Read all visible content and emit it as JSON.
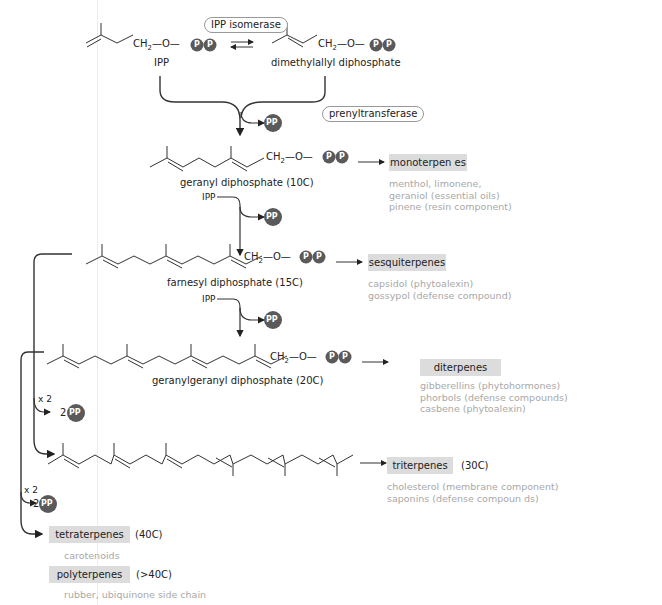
{
  "enzymes": {
    "isomerase": "IPP isomerase",
    "prenyltransferase": "prenyltransferase"
  },
  "molecules": {
    "ipp": "IPP",
    "dmapp": "dimethylallyl diphosphate",
    "gpp": "geranyl diphosphate (10C)",
    "fpp": "farnesyl diphosphate (15C)",
    "ggpp": "geranylgeranyl diphosphate (20C)"
  },
  "chem_group": {
    "ch2": "CH",
    "sub2": "2",
    "o": "—O—",
    "p": "P",
    "pp": "PP"
  },
  "ipp_inputs": {
    "step2": "IPP",
    "step3": "IPP"
  },
  "multipliers": {
    "x2_a": "x 2",
    "x2_b": "x 2",
    "release_a": "2",
    "release_b": "2"
  },
  "classes": [
    {
      "name": "monoterpen es",
      "carbons": "",
      "examples": [
        "menthol, limonene,",
        "geraniol (essential oils)",
        "pinene (resin component)"
      ]
    },
    {
      "name": "sesquiterpenes",
      "carbons": "",
      "examples": [
        "capsidol (phytoalexin)",
        "gossypol (defense compound)"
      ]
    },
    {
      "name": "diterpenes",
      "carbons": "",
      "examples": [
        "gibberellins (phytohormones)",
        "phorbols (defense compounds)",
        "casbene (phytoalexin)"
      ]
    },
    {
      "name": "triterpenes",
      "carbons": "(30C)",
      "examples": [
        "cholesterol (membrane component)",
        "saponins (defense compoun  ds)"
      ]
    },
    {
      "name": "tetraterpenes",
      "carbons": "(40C)",
      "examples": [
        "carotenoids"
      ]
    },
    {
      "name": "polyterpenes",
      "carbons": "(>40C)",
      "examples": [
        "rubber, ubiquinone side chain"
      ]
    }
  ],
  "colors": {
    "line": "#222222",
    "phosphate": "#5a5a5a",
    "class_box": "#dcdcdc",
    "example_text": "#a8a8a8"
  }
}
